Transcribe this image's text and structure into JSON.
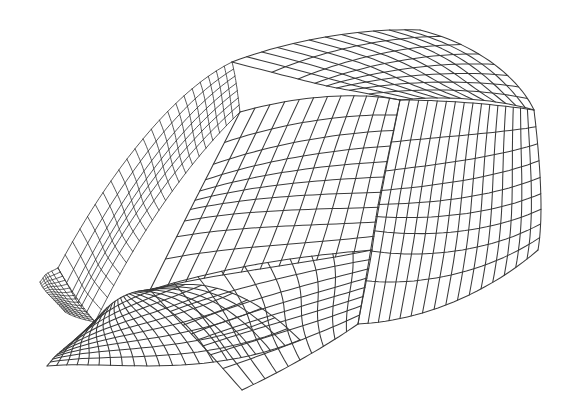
{
  "figure": {
    "kind": "wireframe-surface",
    "background": "#ffffff",
    "line_color": "#3a3a3a",
    "width": 572,
    "height": 414
  },
  "patches": [
    {
      "name": "left-ridge-band",
      "dense": true,
      "nu": 22,
      "nv": 7,
      "corners": [
        [
          58,
          268
        ],
        [
          232,
          62
        ],
        [
          240,
          112
        ],
        [
          95,
          322
        ]
      ],
      "edges": {
        "top": [
          [
            110,
            170
          ],
          [
            175,
            90
          ]
        ],
        "right": [
          [
            236,
            78
          ],
          [
            238,
            96
          ]
        ],
        "bottom": [
          [
            190,
            160
          ],
          [
            140,
            230
          ]
        ],
        "left": [
          [
            70,
            295
          ],
          [
            83,
            310
          ]
        ]
      }
    },
    {
      "name": "left-flap",
      "dense": true,
      "nu": 16,
      "nv": 6,
      "corners": [
        [
          58,
          268
        ],
        [
          95,
          322
        ],
        [
          65,
          312
        ],
        [
          40,
          282
        ]
      ],
      "edges": {
        "top": [
          [
            70,
            290
          ],
          [
            85,
            310
          ]
        ],
        "right": [
          [
            86,
            320
          ],
          [
            75,
            318
          ]
        ],
        "bottom": [
          [
            55,
            300
          ],
          [
            44,
            292
          ]
        ],
        "left": [
          [
            48,
            272
          ],
          [
            42,
            276
          ]
        ]
      }
    },
    {
      "name": "top-right-cap",
      "dense": false,
      "nu": 12,
      "nv": 8,
      "corners": [
        [
          232,
          62
        ],
        [
          420,
          30
        ],
        [
          534,
          110
        ],
        [
          400,
          100
        ]
      ],
      "edges": {
        "top": [
          [
            290,
            40
          ],
          [
            360,
            28
          ]
        ],
        "right": [
          [
            480,
            45
          ],
          [
            520,
            80
          ]
        ],
        "bottom": [
          [
            500,
            100
          ],
          [
            450,
            95
          ]
        ],
        "left": [
          [
            300,
            80
          ],
          [
            360,
            95
          ]
        ]
      }
    },
    {
      "name": "central-dome",
      "dense": false,
      "nu": 12,
      "nv": 10,
      "corners": [
        [
          240,
          112
        ],
        [
          400,
          100
        ],
        [
          372,
          250
        ],
        [
          150,
          290
        ]
      ],
      "edges": {
        "top": [
          [
            300,
            95
          ],
          [
            360,
            92
          ]
        ],
        "right": [
          [
            390,
            150
          ],
          [
            378,
            205
          ]
        ],
        "bottom": [
          [
            300,
            265
          ],
          [
            220,
            272
          ]
        ],
        "left": [
          [
            210,
            170
          ],
          [
            180,
            230
          ]
        ]
      }
    },
    {
      "name": "left-arch",
      "dense": false,
      "nu": 20,
      "nv": 10,
      "corners": [
        [
          95,
          322
        ],
        [
          150,
          290
        ],
        [
          300,
          340
        ],
        [
          47,
          366
        ]
      ],
      "edges": {
        "top": [
          [
            110,
            300
          ],
          [
            130,
            290
          ]
        ],
        "right": [
          [
            210,
            272
          ],
          [
            260,
            300
          ]
        ],
        "bottom": [
          [
            200,
            380
          ],
          [
            110,
            360
          ]
        ],
        "left": [
          [
            60,
            350
          ],
          [
            52,
            360
          ]
        ]
      }
    },
    {
      "name": "bottom-arch",
      "dense": false,
      "nu": 10,
      "nv": 8,
      "corners": [
        [
          150,
          290
        ],
        [
          372,
          250
        ],
        [
          358,
          324
        ],
        [
          242,
          390
        ]
      ],
      "edges": {
        "top": [
          [
            230,
            265
          ],
          [
            310,
            255
          ]
        ],
        "right": [
          [
            368,
            275
          ],
          [
            362,
            300
          ]
        ],
        "bottom": [
          [
            320,
            350
          ],
          [
            280,
            372
          ]
        ],
        "left": [
          [
            180,
            320
          ],
          [
            215,
            360
          ]
        ]
      }
    },
    {
      "name": "right-bulge-fan",
      "dense": false,
      "nu": 16,
      "nv": 9,
      "corners": [
        [
          400,
          100
        ],
        [
          534,
          110
        ],
        [
          538,
          250
        ],
        [
          358,
          324
        ]
      ],
      "edges": {
        "top": [
          [
            450,
            100
          ],
          [
            500,
            105
          ]
        ],
        "right": [
          [
            540,
            160
          ],
          [
            544,
            215
          ]
        ],
        "bottom": [
          [
            480,
            300
          ],
          [
            410,
            322
          ]
        ],
        "left": [
          [
            385,
            170
          ],
          [
            368,
            250
          ]
        ]
      }
    }
  ],
  "landmarks": {
    "left_tip": [
      58,
      268
    ],
    "left_bottom_corner": [
      47,
      366
    ],
    "ridge_peak": [
      420,
      30
    ],
    "right_tip": [
      534,
      110
    ],
    "bottom_pinch": [
      358,
      324
    ],
    "lowest_point": [
      242,
      390
    ]
  }
}
